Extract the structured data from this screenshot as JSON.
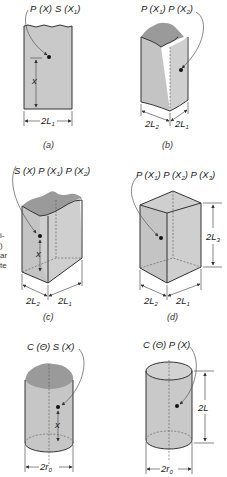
{
  "figure": {
    "panels": [
      {
        "id": "a",
        "caption": "(a)",
        "label": "P (X) S (X₁)",
        "dims": [
          "x",
          "2L₁"
        ],
        "shape": "slab"
      },
      {
        "id": "b",
        "caption": "(b)",
        "label": "P (X₁) P (X₂)",
        "dims": [
          "2L₂",
          "2L₁"
        ],
        "shape": "semi-infinite rectangular bar"
      },
      {
        "id": "c",
        "caption": "(c)",
        "label": "S (X) P (X₁) P (X₂)",
        "dims": [
          "x",
          "2L₂",
          "2L₁"
        ],
        "shape": "semi-infinite rectangular bar with end"
      },
      {
        "id": "d",
        "caption": "(d)",
        "label": "P (X₁) P (X₂) P (X₃)",
        "dims": [
          "2L₃",
          "2L₂",
          "2L₁"
        ],
        "shape": "rectangular parallelepiped"
      },
      {
        "id": "e",
        "caption": "",
        "label": "C (Θ) S (X)",
        "dims": [
          "x",
          "2r₀"
        ],
        "shape": "semi-infinite cylinder"
      },
      {
        "id": "f",
        "caption": "",
        "label": "C (Θ) P (X)",
        "dims": [
          "2L",
          "2r₀"
        ],
        "shape": "finite cylinder"
      }
    ],
    "margin_snippet": [
      "i-",
      ")",
      "ar",
      "te"
    ]
  },
  "labels": {
    "a": {
      "P": "P",
      "X": "(X)",
      "S": "S",
      "X1": "(X",
      "sub1": "1",
      "close": ")",
      "x": "x",
      "w": "2L",
      "wsub": "1",
      "cap": "(a)"
    },
    "b": {
      "t1": "P (X",
      "s1": "1",
      "t2": ") P (X",
      "s2": "2",
      "t3": ")",
      "d2": "2L",
      "d2s": "2",
      "d1": "2L",
      "d1s": "1",
      "cap": "(b)"
    },
    "c": {
      "t1": "S (X) P (X",
      "s1": "1",
      "t2": ") P (X",
      "s2": "2",
      "t3": ")",
      "x": "x",
      "d2": "2L",
      "d2s": "2",
      "d1": "2L",
      "d1s": "1",
      "cap": "(c)"
    },
    "d": {
      "t1": "P (X",
      "s1": "1",
      "t2": ") P (X",
      "s2": "2",
      "t3": ") P (X",
      "s3": "3",
      "t4": ")",
      "h": "2L",
      "hs": "3",
      "d2": "2L",
      "d2s": "2",
      "d1": "2L",
      "d1s": "1",
      "cap": "(d)"
    },
    "e": {
      "t": "C (Θ) S (X)",
      "x": "x",
      "r": "2r",
      "rs": "0"
    },
    "f": {
      "t": "C (Θ) P (X)",
      "h": "2L",
      "r": "2r",
      "rs": "0"
    },
    "snip": [
      "i-",
      ")",
      "ar",
      "te"
    ]
  }
}
